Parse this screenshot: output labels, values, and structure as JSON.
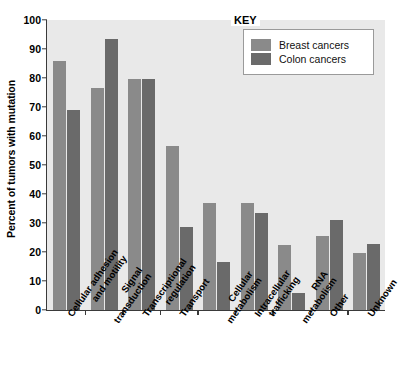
{
  "chart_data": {
    "type": "bar",
    "title": "",
    "xlabel": "",
    "ylabel": "Percent of tumors with mutation",
    "ylim": [
      0,
      100
    ],
    "yticks": [
      0,
      10,
      20,
      30,
      40,
      50,
      60,
      70,
      80,
      90,
      100
    ],
    "grid": false,
    "legend_position": "top-right",
    "legend_title": "KEY",
    "categories": [
      "Cellular adhesion and motility",
      "Signal transduction",
      "Transcriptional regulation",
      "Transport",
      "Cellular metabolism",
      "Intracellular trafficking",
      "RNA metabolism",
      "Other",
      "Unknown"
    ],
    "category_lines": [
      [
        "Cellular adhesion",
        "and motility"
      ],
      [
        "Signal",
        "transduction"
      ],
      [
        "Transcriptional",
        "regulation"
      ],
      [
        "Transport",
        ""
      ],
      [
        "Cellular",
        "metabolism"
      ],
      [
        "Intracellular",
        "trafficking"
      ],
      [
        "RNA",
        "metabolism"
      ],
      [
        "Other",
        ""
      ],
      [
        "Unknown",
        ""
      ]
    ],
    "series": [
      {
        "name": "Breast cancers",
        "color": "#8a8a8a",
        "values": [
          85.7,
          76.7,
          79.7,
          56.5,
          37.0,
          37.0,
          22.5,
          25.5,
          19.5
        ]
      },
      {
        "name": "Colon cancers",
        "color": "#6a6a6a",
        "values": [
          68.8,
          93.6,
          79.7,
          28.6,
          16.5,
          33.5,
          6.0,
          31.0,
          22.8
        ]
      }
    ]
  },
  "axis": {
    "y_title": "Percent of tumors with mutation"
  },
  "legend": {
    "title": "KEY",
    "items": [
      {
        "label": "Breast cancers"
      },
      {
        "label": "Colon cancers"
      }
    ]
  }
}
